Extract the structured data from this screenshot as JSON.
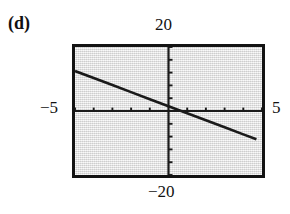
{
  "figure": {
    "part_label": "(d)",
    "background_color": "#ffffff",
    "plot_fill_color": "#e3e3e3",
    "frame_color": "#131313",
    "line_color": "#1a1a1a"
  },
  "labels": {
    "top": "20",
    "bottom": "−20",
    "left": "−5",
    "right": "5"
  },
  "chart_data": {
    "type": "line",
    "title": "(d)",
    "xlabel": "",
    "ylabel": "",
    "xlim": [
      -5,
      5
    ],
    "ylim": [
      -20,
      20
    ],
    "x_axis_end_labels": [
      "−5",
      "5"
    ],
    "y_axis_end_labels": [
      "−20",
      "20"
    ],
    "grid": false,
    "legend": "none",
    "x_tick_interval": 1,
    "y_tick_interval": 4,
    "x_ticks": [
      -5,
      -4,
      -3,
      -2,
      -1,
      0,
      1,
      2,
      3,
      4,
      5
    ],
    "y_ticks": [
      -20,
      -16,
      -12,
      -8,
      -4,
      0,
      4,
      8,
      12,
      16,
      20
    ],
    "series": [
      {
        "name": "line",
        "style": "solid",
        "slope": -2.2,
        "intercept": 1.5,
        "x": [
          -5,
          -4,
          -3,
          -2,
          -1,
          0,
          1,
          2,
          3,
          4,
          4.7
        ],
        "y": [
          12.5,
          10.3,
          8.1,
          5.9,
          3.7,
          1.5,
          -0.7,
          -2.9,
          -5.1,
          -7.3,
          -8.84
        ]
      }
    ]
  }
}
